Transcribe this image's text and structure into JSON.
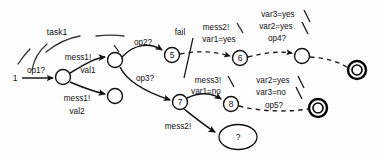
{
  "diagram": {
    "title": "task1",
    "type": "state-transition-diagram",
    "canvas": {
      "width": 384,
      "height": 159
    },
    "region_label": "task1",
    "start_label": "1",
    "unknown_label": "?",
    "nodes": [
      {
        "id": "n_start_entry",
        "label": "",
        "kind": "plain",
        "cx": 63,
        "cy": 77,
        "r": 7.5
      },
      {
        "id": "n_fork",
        "label": "",
        "kind": "plain",
        "cx": 115,
        "cy": 60,
        "r": 7.5
      },
      {
        "id": "n_val2",
        "label": "",
        "kind": "plain",
        "cx": 115,
        "cy": 96,
        "r": 7.5
      },
      {
        "id": "n5",
        "label": "5",
        "kind": "numbered",
        "cx": 172,
        "cy": 55,
        "r": 7.5
      },
      {
        "id": "n6",
        "label": "6",
        "kind": "numbered",
        "cx": 240,
        "cy": 58,
        "r": 7.5
      },
      {
        "id": "n_upper_plain",
        "label": "",
        "kind": "plain",
        "cx": 302,
        "cy": 56,
        "r": 7.5
      },
      {
        "id": "n_final_upper",
        "label": "",
        "kind": "final",
        "cx": 357,
        "cy": 70,
        "r": 8.5
      },
      {
        "id": "n7",
        "label": "7",
        "kind": "numbered",
        "cx": 180,
        "cy": 102,
        "r": 7.5
      },
      {
        "id": "n8",
        "label": "8",
        "kind": "numbered",
        "cx": 231,
        "cy": 104,
        "r": 7.5
      },
      {
        "id": "n_final_lower",
        "label": "",
        "kind": "final",
        "cx": 318,
        "cy": 108,
        "r": 8.5
      },
      {
        "id": "n_unknown",
        "label": "?",
        "kind": "ellipse",
        "cx": 238,
        "cy": 137,
        "rx": 19,
        "ry": 12.5
      }
    ],
    "edges": [
      {
        "id": "e_start",
        "from": "start",
        "to": "n_start_entry",
        "label": "op1?",
        "style": "solid"
      },
      {
        "id": "e_mess1_val1",
        "from": "n_start_entry",
        "to": "n_fork",
        "label_lines": [
          "mess1!",
          "val1"
        ],
        "style": "solid"
      },
      {
        "id": "e_mess1_val2",
        "from": "n_start_entry",
        "to": "n_val2",
        "label_lines": [
          "mess1!",
          "val2"
        ],
        "style": "solid"
      },
      {
        "id": "e_op2",
        "from": "n_fork",
        "to": "n5",
        "label": "op2?",
        "style": "solid"
      },
      {
        "id": "e_op3",
        "from": "n_fork",
        "to": "n7",
        "label": "op3?",
        "style": "solid"
      },
      {
        "id": "e_5_to_6",
        "from": "n5",
        "to": "n6",
        "label_lines": [
          "mess2!",
          "var1=yes"
        ],
        "style": "dashed",
        "annotation": "fail"
      },
      {
        "id": "e_6_to_plain",
        "from": "n6",
        "to": "n_upper_plain",
        "label_lines": [
          "var3=yes",
          "var2=yes",
          "op4?"
        ],
        "style": "dashed"
      },
      {
        "id": "e_plain_to_final_upper",
        "from": "n_upper_plain",
        "to": "n_final_upper",
        "label": "",
        "style": "dashed"
      },
      {
        "id": "e_7_to_8",
        "from": "n7",
        "to": "n8",
        "label_lines": [
          "mess3!",
          "var1=no"
        ],
        "style": "solid"
      },
      {
        "id": "e_8_to_final_lower",
        "from": "n8",
        "to": "n_final_lower",
        "label_lines": [
          "var2=yes",
          "var3=no",
          "op5?"
        ],
        "style": "dashed"
      },
      {
        "id": "e_7_to_unknown",
        "from": "n7",
        "to": "n_unknown",
        "label": "mess2!",
        "style": "solid"
      }
    ],
    "labels": {
      "task1": "task1",
      "op1": "op1?",
      "mess1_a": "mess1!",
      "val1": "val1",
      "mess1_b": "mess1!",
      "val2": "val2",
      "op2": "op2?",
      "op3": "op3?",
      "fail": "fail",
      "mess2_upper": "mess2!",
      "var1_yes": "var1=yes",
      "var3_yes": "var3=yes",
      "var2_yes_upper": "var2=yes",
      "op4": "op4?",
      "mess3": "mess3!",
      "var1_no": "var1=no",
      "var2_yes_lower": "var2=yes",
      "var3_no": "var3=no",
      "op5": "op5?",
      "mess2_lower": "mess2!",
      "start_state": "1",
      "state5": "5",
      "state6": "6",
      "state7": "7",
      "state8": "8",
      "unknown_state": "?"
    },
    "colors": {
      "stroke": "#111111",
      "background": "#ffffff",
      "node_fill": "#ffffff"
    }
  }
}
